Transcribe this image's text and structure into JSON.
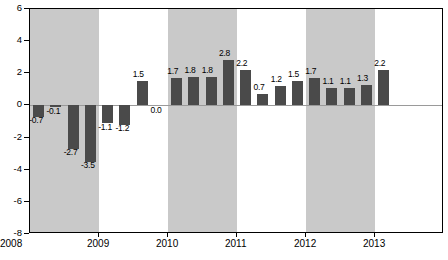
{
  "chart_data": {
    "type": "bar",
    "title": "",
    "subtitle": "",
    "xlabel": "",
    "ylabel": "",
    "ylim": [
      -8,
      6
    ],
    "yticks": [
      6,
      4,
      2,
      0,
      -2,
      -4,
      -6,
      -8
    ],
    "ytick_labels": [
      "6",
      "4",
      "2",
      "0",
      "-2",
      "-4",
      "-6",
      "-8"
    ],
    "xtick_labels": [
      "2008",
      "2009",
      "2010",
      "2011",
      "2012",
      "2013"
    ],
    "grid": false,
    "legend": "none",
    "bar_color": "#4a4a4a",
    "band_color": "#c9c9c9",
    "categories": [
      "2008Q1",
      "2008Q2",
      "2008Q3",
      "2008Q4",
      "2009Q1",
      "2009Q2",
      "2009Q3",
      "2009Q4",
      "2010Q1",
      "2010Q2",
      "2010Q3",
      "2010Q4",
      "2011Q1",
      "2011Q2",
      "2011Q3",
      "2011Q4",
      "2012Q1",
      "2012Q2",
      "2012Q3",
      "2012Q4",
      "2013Q1"
    ],
    "values": [
      -0.7,
      -0.1,
      -2.7,
      -3.5,
      -1.1,
      -1.2,
      1.5,
      0.0,
      1.7,
      1.8,
      1.8,
      2.8,
      2.2,
      0.7,
      1.2,
      1.5,
      1.7,
      1.1,
      1.1,
      1.3,
      2.2
    ],
    "value_labels": [
      "-0.7",
      "-0.1",
      "-2.7",
      "-3.5",
      "-1.1",
      "-1.2",
      "1.5",
      "0.0",
      "1.7",
      "1.8",
      "1.8",
      "2.8",
      "2.2",
      "0.7",
      "1.2",
      "1.5",
      "1.7",
      "1.1",
      "1.1",
      "1.3",
      "2.2"
    ],
    "shaded_bands": [
      {
        "label": "2008",
        "start_index": 0,
        "end_index": 3
      },
      {
        "label": "2010",
        "start_index": 8,
        "end_index": 11
      },
      {
        "label": "2012",
        "start_index": 16,
        "end_index": 19
      }
    ]
  }
}
